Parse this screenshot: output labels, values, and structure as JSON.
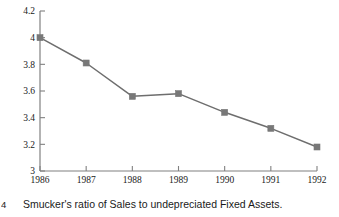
{
  "figure": {
    "number_label": "4",
    "caption": "Smucker's ratio of Sales to undepreciated Fixed Assets."
  },
  "style": {
    "axis_color": "#808080",
    "series_color": "#6e6e6e",
    "marker_color": "#787878",
    "text_color": "#1a1a1a",
    "background": "#ffffff"
  },
  "chart_data": {
    "type": "line",
    "title": "",
    "subtitle": "",
    "xlabel": "",
    "ylabel": "",
    "categories": [
      "1986",
      "1987",
      "1988",
      "1989",
      "1990",
      "1991",
      "1992"
    ],
    "x": [
      1986,
      1987,
      1988,
      1989,
      1990,
      1991,
      1992
    ],
    "values": [
      4.0,
      3.81,
      3.56,
      3.58,
      3.44,
      3.32,
      3.18
    ],
    "series": [
      {
        "name": "Sales / undepreciated Fixed Assets",
        "values": [
          4.0,
          3.81,
          3.56,
          3.58,
          3.44,
          3.32,
          3.18
        ]
      }
    ],
    "ylim": [
      3.0,
      4.2
    ],
    "xlim": [
      1986,
      1992
    ],
    "ytick_labels": [
      "3",
      "3.2",
      "3.4",
      "3.6",
      "3.8",
      "4",
      "4.2"
    ],
    "ytick_values": [
      3.0,
      3.2,
      3.4,
      3.6,
      3.8,
      4.0,
      4.2
    ],
    "xtick_labels": [
      "1986",
      "1987",
      "1988",
      "1989",
      "1990",
      "1991",
      "1992"
    ],
    "grid": false,
    "legend": false,
    "legend_position": "none",
    "marker": "square",
    "annotations": []
  }
}
